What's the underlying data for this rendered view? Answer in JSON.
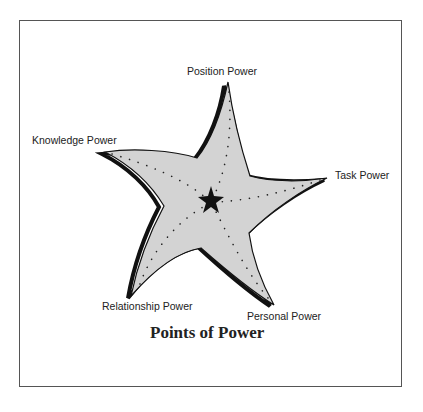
{
  "diagram": {
    "title": "Points of Power",
    "points": [
      {
        "id": "position",
        "label": "Position Power"
      },
      {
        "id": "knowledge",
        "label": "Knowledge Power"
      },
      {
        "id": "task",
        "label": "Task Power"
      },
      {
        "id": "relationship",
        "label": "Relationship Power"
      },
      {
        "id": "personal",
        "label": "Personal Power"
      }
    ],
    "colors": {
      "fill": "#d3d3d3",
      "outline": "#111111",
      "border": "#555555"
    }
  }
}
